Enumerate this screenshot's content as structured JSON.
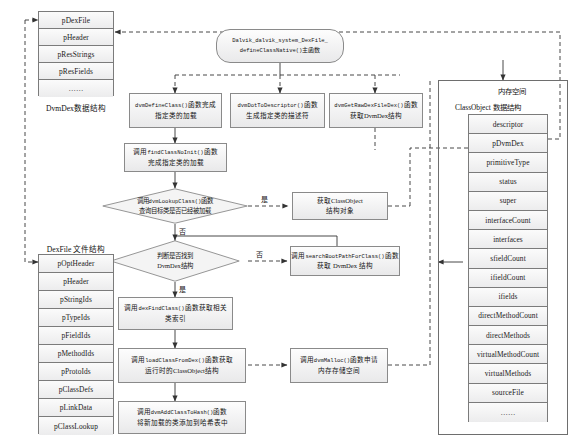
{
  "diagram": {
    "colors": {
      "box_border": "#8a8a8a",
      "box_fill_top": "#fdfdfd",
      "box_fill_bottom": "#e9e9ea",
      "line": "#333333",
      "frame_border": "#6e6e6e"
    }
  },
  "left_structs": {
    "dvmdex": {
      "caption": "DvmDex数据结构",
      "rows": [
        "pDexFile",
        "pHeader",
        "pResStrings",
        "pResFields",
        "……"
      ]
    },
    "dexfile": {
      "caption": "DexFile 文件结构",
      "rows": [
        "pOptHeader",
        "pHeader",
        "pStringIds",
        "pTypeIds",
        "pFieldIds",
        "pMethodIds",
        "pProtoIds",
        "pClassDefs",
        "pLinkData",
        "pClassLookup"
      ]
    }
  },
  "memory": {
    "area_label": "内存空间",
    "classobject": {
      "caption": "ClassObject 数据结构",
      "rows": [
        "descriptor",
        "pDvmDex",
        "primitiveType",
        "status",
        "super",
        "interfaceCount",
        "interfaces",
        "sfieldCount",
        "ifieldCount",
        "ifields",
        "directMethodCount",
        "directMethods",
        "virtualMethodCount",
        "virtualMethods",
        "sourceFile",
        "……"
      ]
    }
  },
  "nodes": {
    "start": {
      "line1": "Dalvik_dalvik_system_DexFile_",
      "line2_code": "defineClassNative()",
      "line2_text": "主函数"
    },
    "define_class": {
      "line1_code": "dvmDefineClass()",
      "line1_text": "函数完成",
      "line2": "指定类的加载"
    },
    "dot_to_descriptor": {
      "line1_code": "dvmDotToDescriptor()",
      "line1_text": "函数",
      "line2": "生成指定类的描述符"
    },
    "get_raw_dexfile": {
      "line1_code": "dvmGetRawDexFileDex()",
      "line1_text": "函数",
      "line2": "获取DvmDex结构"
    },
    "find_class_noinit": {
      "line1_text": "调用",
      "line1_code": "findClassNoInit()",
      "line1_text2": "函数",
      "line2": "完成指定类的加载"
    },
    "lookup_class": {
      "line1_text": "调用",
      "line1_code": "dvmLookupClass()",
      "line1_text2": "函数",
      "line2": "查询目标类是否已经被加载"
    },
    "get_classobject": {
      "line1": "获取ClassObject",
      "line2": "结构对象"
    },
    "check_dvmdex": {
      "line1": "判断是否找到",
      "line2": "DvmDex结构"
    },
    "search_boot_path": {
      "line1_text": "调用",
      "line1_code": "searchBootPathForClass()",
      "line1_text2": "函数",
      "line2": "获取 DvmDex 结构"
    },
    "dex_find_class": {
      "line1_text": "调用",
      "line1_code": "dexFindClass()",
      "line1_text2": "函数获取相关",
      "line2": "类索引"
    },
    "load_class_from_dex": {
      "line1_text": "调用",
      "line1_code": "loadClassFromDex()",
      "line1_text2": "函数获取",
      "line2": "运行时的ClassObject结构"
    },
    "dvm_malloc": {
      "line1_text": "调用",
      "line1_code": "dvmMalloc()",
      "line1_text2": "函数申请",
      "line2": "内存存储空间"
    },
    "add_class_to_hash": {
      "line1_text": "调用",
      "line1_code": "dvmAddClassToHash()",
      "line1_text2": "函数",
      "line2": "将新加载的类添加到哈希表中"
    }
  },
  "edge_labels": {
    "lookup_yes": "是",
    "lookup_no": "否",
    "dvmdex_yes": "是",
    "dvmdex_no": "否",
    "dexfind_yes": "是"
  }
}
